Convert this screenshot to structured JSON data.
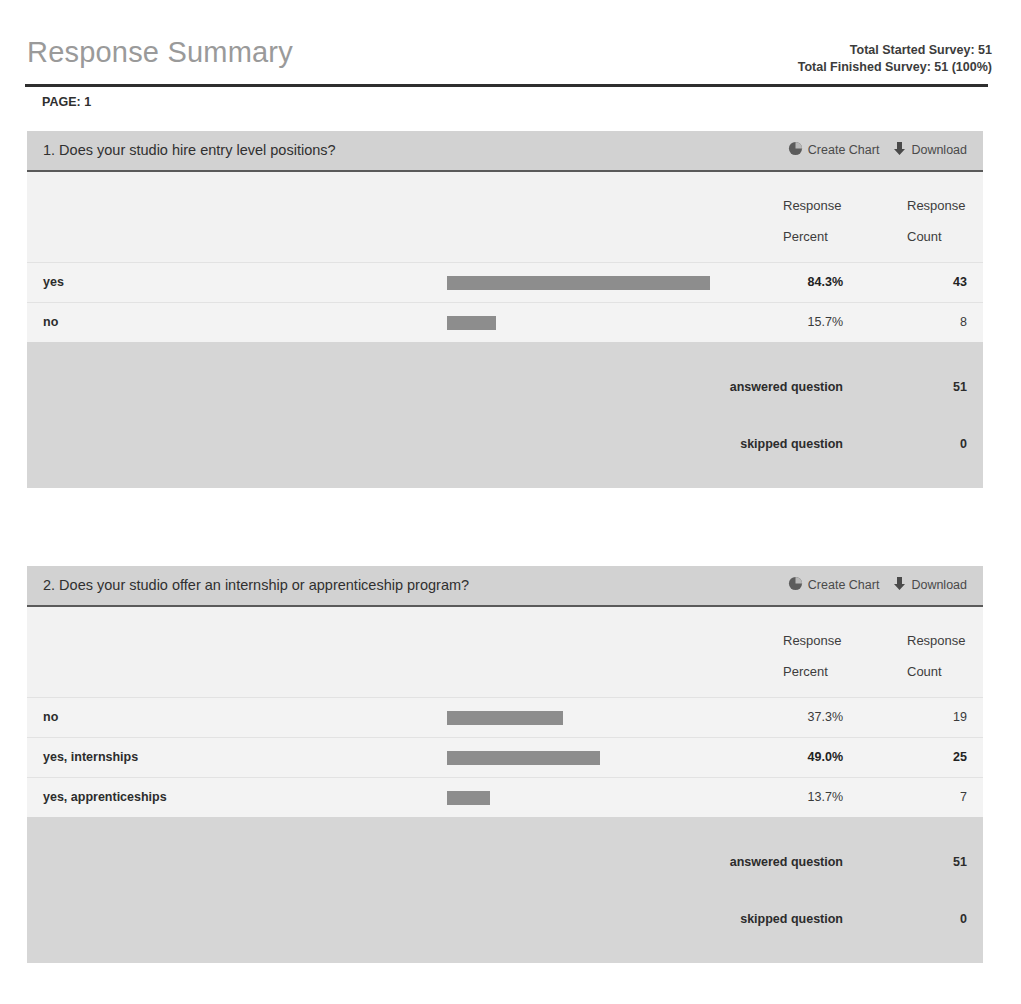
{
  "header": {
    "title": "Response Summary",
    "total_started_label": "Total Started Survey: 51",
    "total_finished_label": "Total Finished Survey: 51  (100%)",
    "page_label": "PAGE: 1"
  },
  "actions": {
    "create_chart_label": "Create Chart",
    "download_label": "Download",
    "create_chart_icon": "pie-chart-icon",
    "download_icon": "download-arrow-icon"
  },
  "table_headers": {
    "response_percent_line1": "Response",
    "response_percent_line2": "Percent",
    "response_count_line1": "Response",
    "response_count_line2": "Count"
  },
  "footer_labels": {
    "answered": "answered question",
    "skipped": "skipped question"
  },
  "colors": {
    "bar": "#8d8d8d",
    "panel_header": "#d2d2d2",
    "panel_footer": "#d6d6d6",
    "title": "#9a9a9a"
  },
  "questions": [
    {
      "title": "1. Does your studio hire entry level positions?",
      "answered_question": "51",
      "skipped_question": "0",
      "rows": [
        {
          "label": "yes",
          "percent": "84.3%",
          "count": "43",
          "value": 84.3,
          "is_max": true
        },
        {
          "label": "no",
          "percent": "15.7%",
          "count": "8",
          "value": 15.7,
          "is_max": false
        }
      ]
    },
    {
      "title": "2. Does your studio offer an internship or apprenticeship program?",
      "answered_question": "51",
      "skipped_question": "0",
      "rows": [
        {
          "label": "no",
          "percent": "37.3%",
          "count": "19",
          "value": 37.3,
          "is_max": false
        },
        {
          "label": "yes, internships",
          "percent": "49.0%",
          "count": "25",
          "value": 49.0,
          "is_max": true
        },
        {
          "label": "yes, apprenticeships",
          "percent": "13.7%",
          "count": "7",
          "value": 13.7,
          "is_max": false
        }
      ]
    }
  ],
  "chart_data": [
    {
      "type": "bar",
      "title": "1. Does your studio hire entry level positions?",
      "categories": [
        "yes",
        "no"
      ],
      "values": [
        84.3,
        15.7
      ],
      "counts": [
        43,
        8
      ],
      "xlabel": "Response Percent",
      "ylabel": "",
      "xlim": [
        0,
        100
      ],
      "grid": false,
      "legend": "none",
      "answered_question": 51,
      "skipped_question": 0
    },
    {
      "type": "bar",
      "title": "2. Does your studio offer an internship or apprenticeship program?",
      "categories": [
        "no",
        "yes, internships",
        "yes, apprenticeships"
      ],
      "values": [
        37.3,
        49.0,
        13.7
      ],
      "counts": [
        19,
        25,
        7
      ],
      "xlabel": "Response Percent",
      "ylabel": "",
      "xlim": [
        0,
        100
      ],
      "grid": false,
      "legend": "none",
      "answered_question": 51,
      "skipped_question": 0
    }
  ]
}
